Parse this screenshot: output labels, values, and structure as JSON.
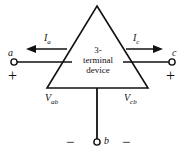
{
  "figure": {
    "device": {
      "shape": "triangle",
      "line1": "3-",
      "line2": "terminal",
      "line3": "device"
    },
    "terminals": [
      {
        "id": "a",
        "label": "a",
        "side": "left",
        "polarity": "+"
      },
      {
        "id": "c",
        "label": "c",
        "side": "right",
        "polarity": "+"
      },
      {
        "id": "b",
        "label": "b",
        "side": "bottom",
        "polarity": "-"
      }
    ],
    "currents": [
      {
        "name": "I_a",
        "symbol": "I",
        "subscript": "a",
        "direction": "left"
      },
      {
        "name": "I_c",
        "symbol": "I",
        "subscript": "c",
        "direction": "right"
      }
    ],
    "voltages": [
      {
        "name": "V_ab",
        "symbol": "V",
        "subscript": "ab"
      },
      {
        "name": "V_cb",
        "symbol": "V",
        "subscript": "cb"
      }
    ],
    "signs": {
      "plus_left": "+",
      "plus_right": "+",
      "minus_left": "−",
      "minus_right": "−"
    },
    "colors": {
      "line": "#111111",
      "background": "#ffffff"
    }
  }
}
